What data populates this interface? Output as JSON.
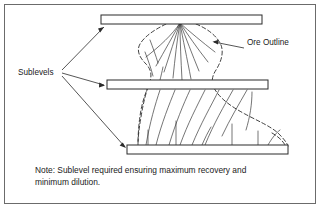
{
  "figure": {
    "frame": {
      "x": 4.5,
      "y": 4.5,
      "width": 311,
      "height": 199,
      "border_color": "#6b6b6b",
      "background_color": "#ffffff"
    }
  },
  "labels": {
    "sublevels": "Sublevels",
    "ore_outline": "Ore Outline"
  },
  "note": {
    "line1": "Note: Sublevel required ensuring maximum recovery and",
    "line2": "minimum dilution."
  },
  "sublevels": [
    {
      "name": "top-sublevel",
      "x": 101,
      "y": 15,
      "width": 161,
      "height": 9
    },
    {
      "name": "middle-sublevel",
      "x": 107,
      "y": 80,
      "width": 161,
      "height": 9
    },
    {
      "name": "bottom-sublevel",
      "x": 127,
      "y": 145,
      "width": 161,
      "height": 9
    }
  ],
  "colors": {
    "line": "#2b2b2b",
    "ring": "#3a3a3a",
    "frame": "#6b6b6b",
    "text": "#1a1a1a",
    "fill": "#ffffff"
  },
  "geometry": {
    "upper_fan_apex_x": 180,
    "upper_fan_apex_y": 23,
    "ore_outline_left_waist_x": 148,
    "ore_outline_right_bulge_x": 289
  }
}
